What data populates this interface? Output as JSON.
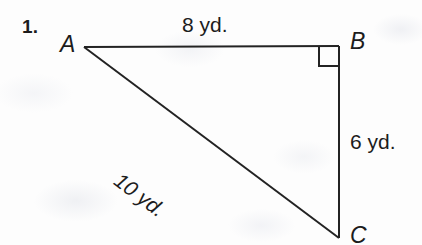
{
  "page": {
    "background_color": "#fdfdfd",
    "ink_color": "#1c1c1c"
  },
  "problem": {
    "number": "1."
  },
  "figure": {
    "type": "right-triangle",
    "vertices": [
      {
        "id": "A",
        "label": "A",
        "x": 84,
        "y": 47,
        "angle_marked": false
      },
      {
        "id": "B",
        "label": "B",
        "x": 339,
        "y": 46,
        "angle_marked": true
      },
      {
        "id": "C",
        "label": "C",
        "x": 339,
        "y": 237,
        "angle_marked": false
      }
    ],
    "sides": [
      {
        "id": "AB",
        "label": "8 yd.",
        "value": 8,
        "unit": "yd."
      },
      {
        "id": "BC",
        "label": "6 yd.",
        "value": 6,
        "unit": "yd."
      },
      {
        "id": "AC",
        "label": "10 yd.",
        "value": 10,
        "unit": "yd."
      }
    ],
    "right_angle_at": "B",
    "right_angle_marker": "right-angle-square"
  }
}
